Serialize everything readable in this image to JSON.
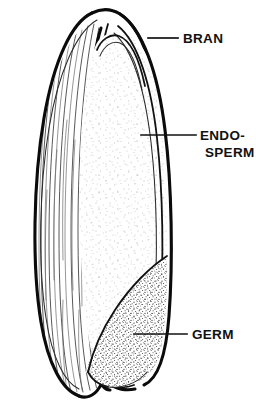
{
  "figure": {
    "type": "botanical-line-diagram",
    "background_color": "#ffffff",
    "ink_color": "#111111",
    "width": 256,
    "height": 404
  },
  "labels": [
    {
      "id": "bran",
      "text": "BRAN",
      "lines": [
        "BRAN"
      ],
      "text_x": 183,
      "text_y": 39,
      "leader_from_x": 148,
      "leader_from_y": 38,
      "leader_to_x": 178,
      "leader_to_y": 38
    },
    {
      "id": "endosperm",
      "text": "ENDO-SPERM",
      "lines": [
        "ENDO-",
        "SPERM"
      ],
      "text_x": 200,
      "text_y": 136,
      "line_height": 17,
      "leader_from_x": 141,
      "leader_from_y": 135,
      "leader_to_x": 196,
      "leader_to_y": 135
    },
    {
      "id": "germ",
      "text": "GERM",
      "lines": [
        "GERM"
      ],
      "text_x": 192,
      "text_y": 335,
      "leader_from_x": 134,
      "leader_from_y": 334,
      "leader_to_x": 187,
      "leader_to_y": 334
    }
  ],
  "regions": [
    {
      "id": "bran-hull",
      "name": "bran",
      "texture": "vertical-striations",
      "fill": "#ffffff"
    },
    {
      "id": "endosperm-body",
      "name": "endosperm",
      "texture": "sparse-stipple",
      "fill": "#ffffff"
    },
    {
      "id": "germ-body",
      "name": "germ",
      "texture": "dense-stipple",
      "fill": "#ffffff"
    }
  ]
}
